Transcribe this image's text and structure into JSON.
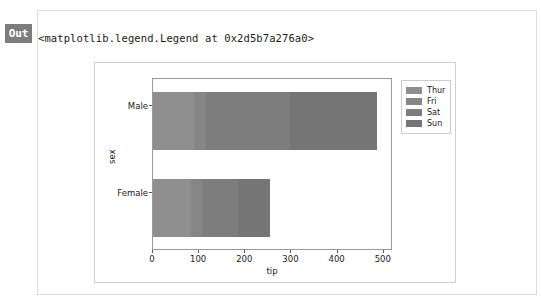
{
  "cell": {
    "out_badge": "Out",
    "repr_text": "<matplotlib.legend.Legend at 0x2d5b7a276a0>"
  },
  "chart_data": {
    "type": "bar",
    "orientation": "horizontal",
    "stacked": true,
    "title": "",
    "xlabel": "tip",
    "ylabel": "sex",
    "categories": [
      "Male",
      "Female"
    ],
    "xlim": [
      0,
      520
    ],
    "xticks": [
      0,
      100,
      200,
      300,
      400,
      500
    ],
    "xtick_labels": [
      "0",
      "100",
      "200",
      "300",
      "400",
      "500"
    ],
    "grid": false,
    "legend_position": "upper right outside",
    "series": [
      {
        "name": "Thur",
        "color": "#8f8f8f",
        "values": [
          89,
          82
        ]
      },
      {
        "name": "Fri",
        "color": "#868686",
        "values": [
          26,
          25
        ]
      },
      {
        "name": "Sat",
        "color": "#7d7d7d",
        "values": [
          181,
          78
        ]
      },
      {
        "name": "Sun",
        "color": "#757575",
        "values": [
          190,
          69
        ]
      }
    ],
    "totals": [
      486,
      254
    ]
  }
}
